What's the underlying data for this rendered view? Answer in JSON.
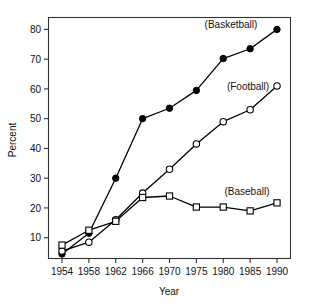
{
  "chart_data": {
    "type": "line",
    "title": "",
    "xlabel": "Year",
    "ylabel": "Percent",
    "categories": [
      "1954",
      "1958",
      "1962",
      "1966",
      "1970",
      "1975",
      "1980",
      "1985",
      "1990"
    ],
    "xtick_labels": [
      "1954",
      "1958",
      "1962",
      "1966",
      "1970",
      "1975",
      "1980",
      "1985",
      "1990"
    ],
    "ytick_labels": [
      "10",
      "20",
      "30",
      "40",
      "50",
      "60",
      "70",
      "80"
    ],
    "ytick_values": [
      10,
      20,
      30,
      40,
      50,
      60,
      70,
      80
    ],
    "ylim": [
      3,
      84
    ],
    "xlim": [
      0,
      8
    ],
    "grid": false,
    "legend_position": "inline-annotations",
    "series": [
      {
        "name": "(Basketball)",
        "marker": "filled-circle",
        "annotation": "(Basketball)",
        "values": [
          4.5,
          11.5,
          30.0,
          50.0,
          53.5,
          59.5,
          70.2,
          73.5,
          80.0
        ]
      },
      {
        "name": "(Football)",
        "marker": "open-circle",
        "annotation": "(Football)",
        "values": [
          5.5,
          8.5,
          16.0,
          25.0,
          33.0,
          41.5,
          49.0,
          53.0,
          61.0
        ]
      },
      {
        "name": "(Baseball)",
        "marker": "open-square",
        "annotation": "(Baseball)",
        "values": [
          7.5,
          12.5,
          15.5,
          23.5,
          24.0,
          20.3,
          20.3,
          19.0,
          21.7
        ]
      }
    ],
    "annotations": [
      {
        "text": "(Basketball)",
        "x_pixel": 231,
        "y_pixel": 28
      },
      {
        "text": "(Football)",
        "x_pixel": 248,
        "y_pixel": 90
      },
      {
        "text": "(Baseball)",
        "x_pixel": 247,
        "y_pixel": 195
      }
    ],
    "colors": {
      "axis": "#333333",
      "line": "#000000",
      "marker_fill_open": "#ffffff",
      "marker_fill_solid": "#000000",
      "background": "#ffffff"
    }
  }
}
